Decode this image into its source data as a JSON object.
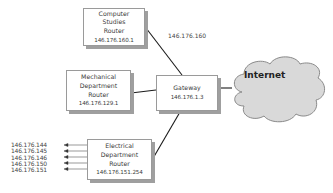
{
  "diagram": {
    "nodes": {
      "computer_studies": {
        "lines": [
          "Computer",
          "Studies",
          "Router"
        ],
        "ip": "146.176.160.1"
      },
      "mechanical": {
        "lines": [
          "Mechanical",
          "Department",
          "Router"
        ],
        "ip": "146.176.129.1"
      },
      "gateway": {
        "lines": [
          "Gateway"
        ],
        "ip": "146.176.1.3"
      },
      "electrical": {
        "lines": [
          "Electrical",
          "Department",
          "Router"
        ],
        "ip": "146.176.151.254"
      },
      "internet": {
        "label": "Internet"
      }
    },
    "link_labels": {
      "computer_studies_gateway": "146.176.160"
    },
    "electrical_hosts": [
      "146.176.144",
      "146.176.145",
      "146.176.146",
      "146.176.150",
      "146.176.151"
    ],
    "colors": {
      "cloud_fill": "#d9d9d9",
      "cloud_stroke": "#8a8a8a",
      "line": "#1a1a1a",
      "shadow": "#9f9f9f"
    }
  }
}
